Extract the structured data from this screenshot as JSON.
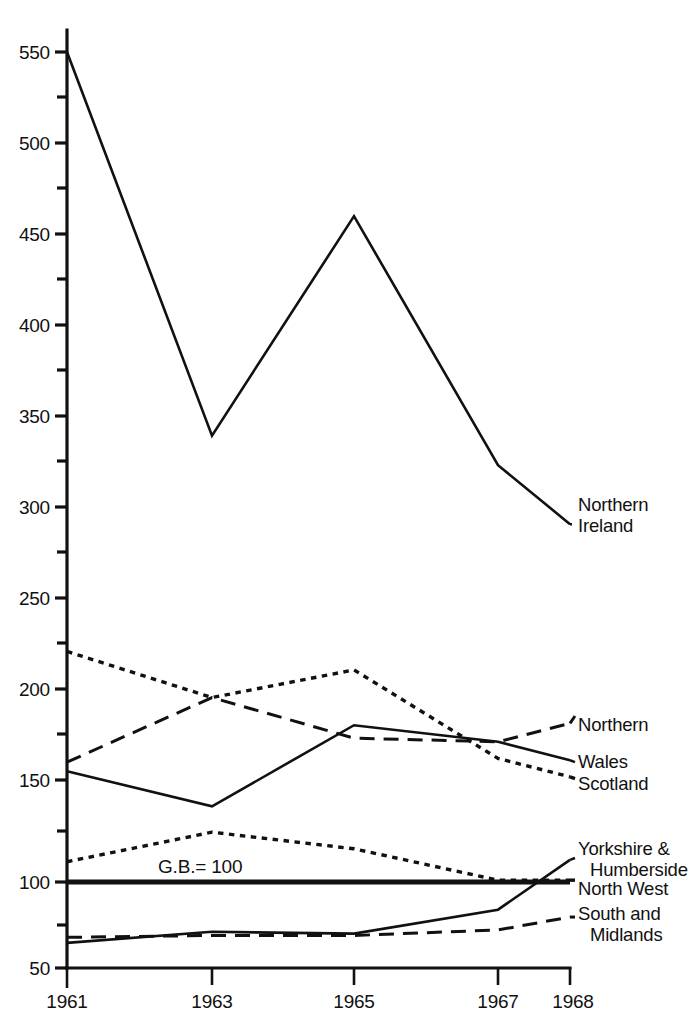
{
  "chart_data": {
    "type": "line",
    "title": "",
    "subtitle": "",
    "xlabel": "",
    "ylabel": "",
    "xlim": [
      1961,
      1968
    ],
    "ylim": [
      50,
      560
    ],
    "grid": false,
    "legend_position": "right-inline-labels",
    "x": [
      1961,
      1963,
      1965,
      1967,
      1968
    ],
    "x_tick_labels": [
      "1961",
      "1963",
      "1965",
      "1967",
      "1968"
    ],
    "y_tick_labels": [
      "50",
      "100",
      "150",
      "200",
      "250",
      "300",
      "350",
      "400",
      "450",
      "500",
      "550"
    ],
    "y_ticks": [
      50,
      100,
      150,
      200,
      250,
      300,
      350,
      400,
      450,
      500,
      550
    ],
    "y_minor_ticks": [
      75,
      125,
      175,
      225,
      275,
      325,
      375,
      425,
      475,
      525
    ],
    "reference_line": {
      "label": "G.B.= 100",
      "value": 100
    },
    "series": [
      {
        "name": "Northern Ireland",
        "label_lines": [
          "Northern",
          "Ireland"
        ],
        "style": "solid",
        "values": [
          550,
          342,
          461,
          326,
          294
        ]
      },
      {
        "name": "Scotland",
        "label_lines": [
          "Scotland"
        ],
        "style": "dotted",
        "values": [
          225,
          200,
          215,
          167,
          157
        ]
      },
      {
        "name": "Northern",
        "label_lines": [
          "Northern"
        ],
        "style": "dashed",
        "values": [
          165,
          200,
          178,
          176,
          186
        ]
      },
      {
        "name": "Wales",
        "label_lines": [
          "Wales"
        ],
        "style": "solid",
        "values": [
          160,
          141,
          185,
          176,
          166
        ]
      },
      {
        "name": "North West",
        "label_lines": [
          "North West"
        ],
        "style": "dotted",
        "values": [
          111,
          127,
          118,
          101,
          101
        ]
      },
      {
        "name": "Yorkshire & Humberside",
        "label_lines": [
          "Yorkshire &",
          "Humberside"
        ],
        "style": "solid",
        "values": [
          67,
          73,
          72,
          85,
          112
        ]
      },
      {
        "name": "South and Midlands",
        "label_lines": [
          "South and",
          "Midlands"
        ],
        "style": "dashed",
        "values": [
          70,
          71,
          71,
          74,
          81
        ]
      }
    ]
  },
  "annotations": {
    "series_labels": [
      {
        "key": "northern-ireland",
        "lines": [
          "Northern",
          "Ireland"
        ]
      },
      {
        "key": "northern",
        "lines": [
          "Northern"
        ]
      },
      {
        "key": "wales",
        "lines": [
          "Wales"
        ]
      },
      {
        "key": "scotland",
        "lines": [
          "Scotland"
        ]
      },
      {
        "key": "yorkshire-humberside",
        "lines": [
          "Yorkshire &",
          "Humberside"
        ]
      },
      {
        "key": "north-west",
        "lines": [
          "North West"
        ]
      },
      {
        "key": "south-and-midlands",
        "lines": [
          "South and",
          "Midlands"
        ]
      }
    ],
    "gb_reference": "G.B.= 100"
  },
  "axes": {
    "y_labels": [
      "550",
      "500",
      "450",
      "400",
      "350",
      "300",
      "250",
      "200",
      "150",
      "100",
      "50"
    ],
    "x_labels": [
      "1961",
      "1963",
      "1965",
      "1967",
      "1968"
    ]
  },
  "labels": {
    "y550": "550",
    "y500": "500",
    "y450": "450",
    "y400": "400",
    "y350": "350",
    "y300": "300",
    "y250": "250",
    "y200": "200",
    "y150": "150",
    "y100": "100",
    "y50": "50",
    "x1961": "1961",
    "x1963": "1963",
    "x1965": "1965",
    "x1967": "1967",
    "x1968": "1968",
    "gb": "G.B.= 100",
    "northern_ireland_1": "Northern",
    "northern_ireland_2": "Ireland",
    "northern": "Northern",
    "wales": "Wales",
    "scotland": "Scotland",
    "yorkshire_1": "Yorkshire &",
    "yorkshire_2": "Humberside",
    "north_west": "North West",
    "south_1": "South and",
    "south_2": "Midlands"
  }
}
